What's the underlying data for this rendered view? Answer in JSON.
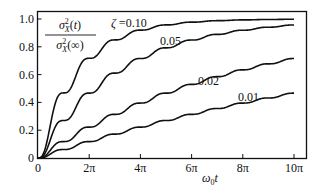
{
  "chart_data": {
    "type": "line",
    "title": "",
    "ylabel_formula": {
      "numerator": "σ²X(t)",
      "denominator": "σ²X(∞)"
    },
    "xlabel": "ω0t",
    "xlim": [
      0,
      31.416
    ],
    "ylim": [
      0,
      1.0
    ],
    "x_ticks": [
      {
        "value": 0,
        "label": "0"
      },
      {
        "value": 6.283,
        "label": "2π"
      },
      {
        "value": 12.566,
        "label": "4π"
      },
      {
        "value": 18.85,
        "label": "6π"
      },
      {
        "value": 25.133,
        "label": "8π"
      },
      {
        "value": 31.416,
        "label": "10π"
      }
    ],
    "y_ticks": [
      {
        "value": 0,
        "label": "0"
      },
      {
        "value": 0.2,
        "label": "0.2"
      },
      {
        "value": 0.4,
        "label": "0.4"
      },
      {
        "value": 0.6,
        "label": "0.6"
      },
      {
        "value": 0.8,
        "label": "0.8"
      },
      {
        "value": 1.0,
        "label": "1.0"
      }
    ],
    "grid": false,
    "x": [
      0,
      3.14,
      6.28,
      9.42,
      12.57,
      15.71,
      18.85,
      21.99,
      25.13,
      28.27,
      31.42
    ],
    "series": [
      {
        "name": "ζ = 0.10",
        "zeta": 0.1,
        "label": "ζ =0.10",
        "values": [
          0,
          0.47,
          0.72,
          0.85,
          0.92,
          0.96,
          0.98,
          0.99,
          0.99,
          1.0,
          1.0
        ]
      },
      {
        "name": "ζ = 0.05",
        "zeta": 0.05,
        "label": "0.05",
        "values": [
          0,
          0.27,
          0.47,
          0.61,
          0.72,
          0.79,
          0.85,
          0.89,
          0.92,
          0.94,
          0.96
        ]
      },
      {
        "name": "ζ = 0.02",
        "zeta": 0.02,
        "label": "0.02",
        "values": [
          0,
          0.12,
          0.22,
          0.31,
          0.4,
          0.47,
          0.53,
          0.58,
          0.63,
          0.68,
          0.71
        ]
      },
      {
        "name": "ζ = 0.01",
        "zeta": 0.01,
        "label": "0.01",
        "values": [
          0,
          0.06,
          0.12,
          0.17,
          0.22,
          0.27,
          0.31,
          0.36,
          0.39,
          0.43,
          0.47
        ]
      }
    ],
    "legend_position": "inline-labels"
  }
}
